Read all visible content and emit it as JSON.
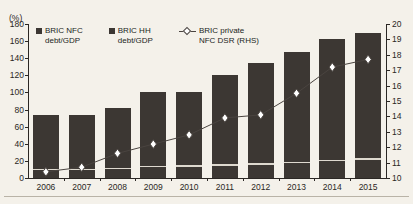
{
  "chart_data": {
    "type": "bar",
    "title": "",
    "subtitle": "",
    "xlabel": "",
    "ylabel": "(%)",
    "y2label": "",
    "categories": [
      "2006",
      "2007",
      "2008",
      "2009",
      "2010",
      "2011",
      "2012",
      "2013",
      "2014",
      "2015"
    ],
    "ylim": [
      0,
      180
    ],
    "y2lim": [
      10,
      20
    ],
    "yticks": [
      0,
      20,
      40,
      60,
      80,
      100,
      120,
      140,
      160,
      180
    ],
    "y2ticks": [
      10,
      11,
      12,
      13,
      14,
      15,
      16,
      17,
      18,
      19,
      20
    ],
    "grid": false,
    "legend_position": "top-left",
    "stacked": true,
    "series": [
      {
        "name": "BRIC HH debt/GDP",
        "type": "bar",
        "axis": "left",
        "color": "#3c3733",
        "values": [
          11,
          11,
          12,
          14,
          15,
          16,
          17,
          19,
          21,
          23
        ]
      },
      {
        "name": "BRIC NFC debt/GDP",
        "type": "bar",
        "axis": "left",
        "color": "#3c3733",
        "values": [
          63,
          63,
          70,
          87,
          86,
          104,
          117,
          128,
          141,
          147
        ]
      },
      {
        "name": "BRIC private NFC DSR (RHS)",
        "type": "line",
        "axis": "right",
        "color": "#4a4440",
        "marker": "diamond",
        "values": [
          10.4,
          10.7,
          11.6,
          12.2,
          12.8,
          13.9,
          14.1,
          15.5,
          17.2,
          17.7
        ]
      }
    ],
    "totals": [
      74,
      74,
      82,
      101,
      101,
      120,
      134,
      147,
      162,
      170
    ]
  },
  "legend": {
    "items": [
      {
        "label": "BRIC NFC\ndebt/GDP",
        "marker": "square",
        "color": "#3c3733"
      },
      {
        "label": "BRIC HH\ndebt/GDP",
        "marker": "square",
        "color": "#3c3733"
      },
      {
        "label": "BRIC private\nNFC DSR (RHS)",
        "marker": "line-diamond",
        "color": "#4a4440"
      }
    ]
  },
  "axes": {
    "left_unit": "(%)",
    "left_ticks": [
      "180",
      "160",
      "140",
      "120",
      "100",
      "80",
      "60",
      "40",
      "20",
      "0"
    ],
    "right_ticks": [
      "20",
      "19",
      "18",
      "17",
      "16",
      "15",
      "14",
      "13",
      "12",
      "11",
      "10"
    ],
    "x_ticks": [
      "2006",
      "2007",
      "2008",
      "2009",
      "2010",
      "2011",
      "2012",
      "2013",
      "2014",
      "2015"
    ]
  }
}
